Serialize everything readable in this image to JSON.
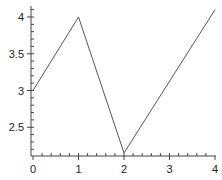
{
  "chart_data": {
    "type": "line",
    "title": "",
    "xlabel": "",
    "ylabel": "",
    "x": [
      0,
      1,
      2,
      4
    ],
    "series": [
      {
        "name": "series",
        "values": [
          3.0,
          4.0,
          2.15,
          4.1
        ],
        "color": "#555555"
      }
    ],
    "xlim": [
      -0.05,
      4.0
    ],
    "ylim": [
      2.12,
      4.13
    ],
    "xticks": [
      "0",
      "1",
      "2",
      "3",
      "4"
    ],
    "yticks": [
      "2.5",
      "3",
      "3.5",
      "4"
    ],
    "grid": false,
    "legend": "none"
  }
}
